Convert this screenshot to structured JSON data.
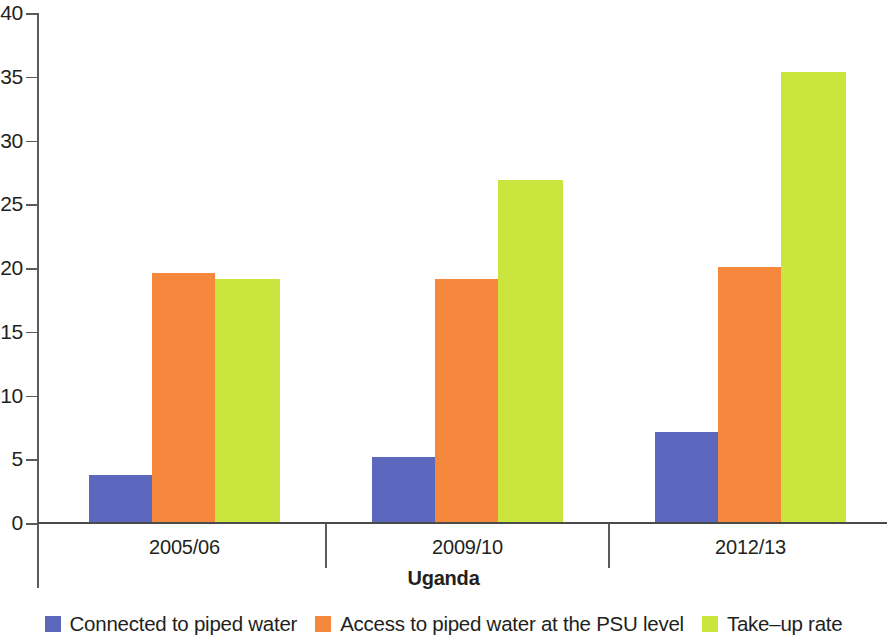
{
  "chart_data": {
    "type": "bar",
    "title": "",
    "subtitle": "",
    "xlabel": "Uganda",
    "ylabel": "",
    "categories": [
      "2005/06",
      "2009/10",
      "2012/13"
    ],
    "series": [
      {
        "name": "Connected to piped water",
        "color": "#5b68bd",
        "values": [
          3.8,
          5.2,
          7.1
        ]
      },
      {
        "name": "Access to piped water at the PSU level",
        "color": "#f5883c",
        "values": [
          19.6,
          19.1,
          20.1
        ]
      },
      {
        "name": "Take–up rate",
        "color": "#cbe53f",
        "values": [
          19.1,
          26.9,
          35.4
        ]
      }
    ],
    "ylim": [
      0,
      40
    ],
    "yticks": [
      0,
      5,
      10,
      15,
      20,
      25,
      30,
      35,
      40
    ],
    "ytick_labels": [
      "0",
      "5",
      "10",
      "15",
      "20",
      "25",
      "30",
      "35",
      "40"
    ],
    "grid": false,
    "legend_position": "bottom",
    "axis_color": "#5a5a5a",
    "background_color": "#ffffff"
  },
  "legend": {
    "items": [
      {
        "label": "Connected to piped water",
        "color": "#5b68bd"
      },
      {
        "label": "Access to piped water at the PSU level",
        "color": "#f5883c"
      },
      {
        "label": "Take–up rate",
        "color": "#cbe53f"
      }
    ]
  }
}
